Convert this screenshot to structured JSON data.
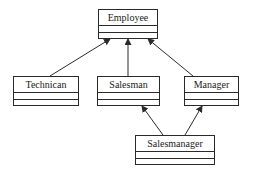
{
  "diagram": {
    "type": "uml-class-diagram",
    "classes": [
      {
        "id": "employee",
        "name": "Employee",
        "attributes": [],
        "operations": []
      },
      {
        "id": "technican",
        "name": "Technican",
        "attributes": [],
        "operations": []
      },
      {
        "id": "salesman",
        "name": "Salesman",
        "attributes": [],
        "operations": []
      },
      {
        "id": "manager",
        "name": "Manager",
        "attributes": [],
        "operations": []
      },
      {
        "id": "salesmanager",
        "name": "Salesmanager",
        "attributes": [],
        "operations": []
      }
    ],
    "relations": [
      {
        "from": "Technican",
        "to": "Employee",
        "kind": "inheritance"
      },
      {
        "from": "Salesman",
        "to": "Employee",
        "kind": "inheritance"
      },
      {
        "from": "Manager",
        "to": "Employee",
        "kind": "inheritance"
      },
      {
        "from": "Salesmanager",
        "to": "Salesman",
        "kind": "inheritance"
      },
      {
        "from": "Salesmanager",
        "to": "Manager",
        "kind": "inheritance"
      }
    ],
    "colors": {
      "stroke": "#2a2a2a",
      "background": "#ffffff",
      "text": "#1a1a1a"
    }
  }
}
